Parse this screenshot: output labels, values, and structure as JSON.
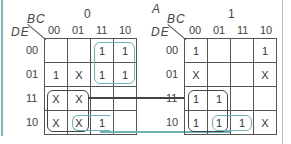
{
  "colors": {
    "teal": "#6fb3b6",
    "dark": "#444444",
    "grid": "#555555"
  },
  "maps": [
    {
      "a_value": "0",
      "a_label": "",
      "col_var": "BC",
      "row_var": "DE",
      "col_headers": [
        "00",
        "01",
        "11",
        "10"
      ],
      "row_headers": [
        "00",
        "01",
        "11",
        "10"
      ],
      "cells": [
        [
          "",
          "",
          "1",
          "1"
        ],
        [
          "1",
          "X",
          "1",
          "1"
        ],
        [
          "X",
          "X",
          "",
          ""
        ],
        [
          "X",
          "X",
          "1",
          ""
        ]
      ]
    },
    {
      "a_value": "1",
      "a_label": "A",
      "col_var": "BC",
      "row_var": "DE",
      "col_headers": [
        "00",
        "01",
        "11",
        "10"
      ],
      "row_headers": [
        "00",
        "01",
        "11",
        "10"
      ],
      "cells": [
        [
          "1",
          "",
          "",
          "1"
        ],
        [
          "X",
          "",
          "",
          "X"
        ],
        [
          "1",
          "1",
          "",
          ""
        ],
        [
          "1",
          "1",
          "1",
          "X"
        ]
      ]
    }
  ],
  "groupings": [
    {
      "map": 0,
      "rows": [
        0,
        1
      ],
      "cols": [
        2,
        3
      ],
      "color": "teal"
    },
    {
      "map": 0,
      "rows": [
        2,
        3
      ],
      "cols": [
        0,
        1
      ],
      "color": "dark",
      "spans_to_map": 1
    },
    {
      "map": 0,
      "rows": [
        3
      ],
      "cols": [
        1,
        2
      ],
      "color": "teal",
      "spans_to_map": 1
    },
    {
      "map": 1,
      "rows": [
        2,
        3
      ],
      "cols": [
        0,
        1
      ],
      "color": "dark"
    },
    {
      "map": 1,
      "rows": [
        3
      ],
      "cols": [
        1,
        2
      ],
      "color": "teal"
    }
  ]
}
